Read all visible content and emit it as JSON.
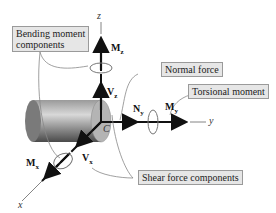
{
  "figure": {
    "labels": {
      "bending": "Bending moment components",
      "bending_line1": "Bending moment",
      "bending_line2": "components",
      "normal": "Normal force",
      "torsional": "Torsional moment",
      "shear": "Shear force components"
    },
    "axes": {
      "x": "x",
      "y": "y",
      "z": "z"
    },
    "centroid": "C",
    "symbols": {
      "Mz": {
        "base": "M",
        "sub": "z"
      },
      "Vz": {
        "base": "V",
        "sub": "z"
      },
      "Ny": {
        "base": "N",
        "sub": "y"
      },
      "My": {
        "base": "M",
        "sub": "y"
      },
      "Mx": {
        "base": "M",
        "sub": "x"
      },
      "Vx": {
        "base": "V",
        "sub": "x"
      }
    },
    "colors": {
      "label_fill": "#e6e6e6",
      "label_border": "#9a9a9a",
      "arrow": "#111111",
      "cylinder_dark": "#555555",
      "cylinder_light": "#cfcfcf",
      "face": "#b0b0b0"
    }
  }
}
